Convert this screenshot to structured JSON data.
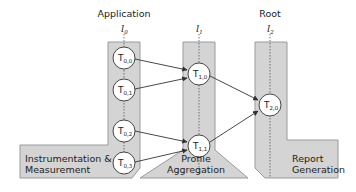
{
  "headers": [
    {
      "label": "Application",
      "level": "l",
      "level_sub": "0"
    },
    {
      "label": "",
      "level": "l",
      "level_sub": "1"
    },
    {
      "label": "Root",
      "level": "l",
      "level_sub": "2"
    }
  ],
  "stages": [
    {
      "line1": "Instrumentation &",
      "line2": "Measurement"
    },
    {
      "line1": "Profile",
      "line2": "Aggregation"
    },
    {
      "line1": "Report",
      "line2": "Generation"
    }
  ],
  "nodes": [
    {
      "id": "T0,0",
      "base": "T",
      "sub": "0,0"
    },
    {
      "id": "T0,1",
      "base": "T",
      "sub": "0,1"
    },
    {
      "id": "T0,2",
      "base": "T",
      "sub": "0,2"
    },
    {
      "id": "T0,3",
      "base": "T",
      "sub": "0,3"
    },
    {
      "id": "T1,0",
      "base": "T",
      "sub": "1,0"
    },
    {
      "id": "T1,1",
      "base": "T",
      "sub": "1,1"
    },
    {
      "id": "T2,0",
      "base": "T",
      "sub": "2,0"
    }
  ],
  "edges": [
    {
      "from": "T0,0",
      "to": "T1,0"
    },
    {
      "from": "T0,1",
      "to": "T1,0"
    },
    {
      "from": "T0,2",
      "to": "T1,1"
    },
    {
      "from": "T0,3",
      "to": "T1,1"
    },
    {
      "from": "T1,0",
      "to": "T2,0"
    },
    {
      "from": "T1,1",
      "to": "T2,0"
    }
  ],
  "colors": {
    "region_fill": "#d4d4d4",
    "region_stroke": "#9a9a9a",
    "node_fill": "#ffffff",
    "node_stroke": "#333333",
    "edge": "#333333",
    "level_line": "#555555"
  }
}
